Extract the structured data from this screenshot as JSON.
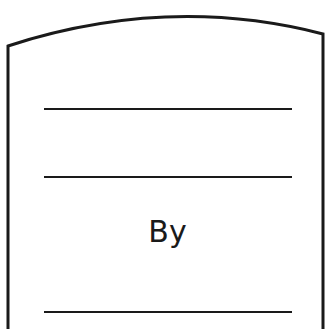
{
  "template": {
    "by_label": "By",
    "lines": [
      "title-line-1",
      "title-line-2",
      "author-line"
    ]
  },
  "colors": {
    "ink": "#1a1a1a",
    "paper": "#ffffff"
  }
}
